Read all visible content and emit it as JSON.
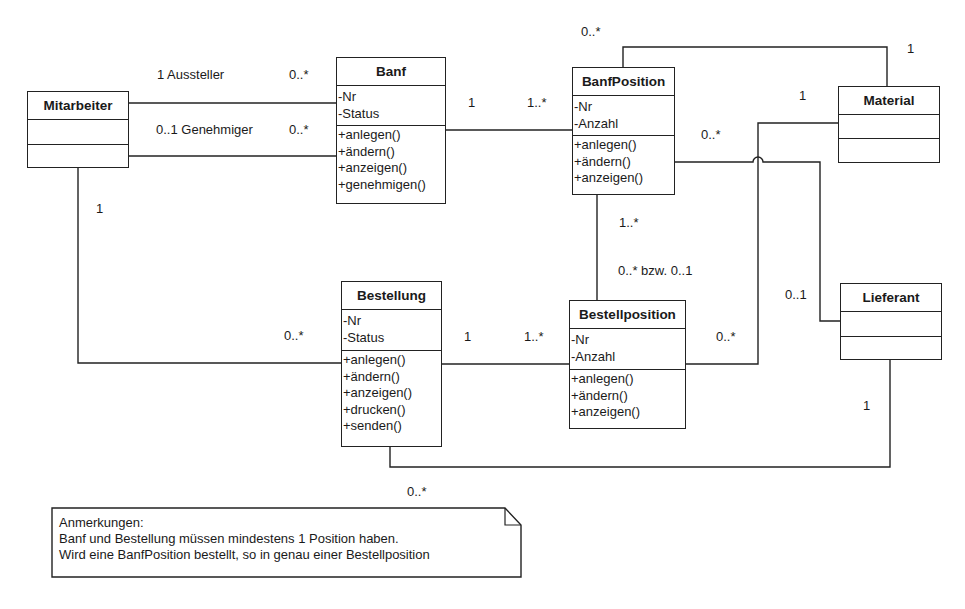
{
  "diagram": {
    "type": "UML class diagram",
    "classes": {
      "mitarbeiter": {
        "name": "Mitarbeiter",
        "attributes": [],
        "operations": []
      },
      "banf": {
        "name": "Banf",
        "attributes": [
          "-Nr",
          "-Status"
        ],
        "operations": [
          "+anlegen()",
          "+ändern()",
          "+anzeigen()",
          "+genehmigen()"
        ]
      },
      "banfposition": {
        "name": "BanfPosition",
        "attributes": [
          "-Nr",
          "-Anzahl"
        ],
        "operations": [
          "+anlegen()",
          "+ändern()",
          "+anzeigen()"
        ]
      },
      "material": {
        "name": "Material",
        "attributes": [],
        "operations": []
      },
      "bestellung": {
        "name": "Bestellung",
        "attributes": [
          "-Nr",
          "-Status"
        ],
        "operations": [
          "+anlegen()",
          "+ändern()",
          "+anzeigen()",
          "+drucken()",
          "+senden()"
        ]
      },
      "bestellposition": {
        "name": "Bestellposition",
        "attributes": [
          "-Nr",
          "-Anzahl"
        ],
        "operations": [
          "+anlegen()",
          "+ändern()",
          "+anzeigen()"
        ]
      },
      "lieferant": {
        "name": "Lieferant",
        "attributes": [],
        "operations": []
      }
    },
    "associations": [
      {
        "from": "Mitarbeiter",
        "to": "Banf",
        "role": "Aussteller",
        "from_mult": "1",
        "to_mult": "0..*"
      },
      {
        "from": "Mitarbeiter",
        "to": "Banf",
        "role": "Genehmiger",
        "from_mult": "0..1",
        "to_mult": "0..*"
      },
      {
        "from": "Banf",
        "to": "BanfPosition",
        "from_mult": "1",
        "to_mult": "1..*"
      },
      {
        "from": "BanfPosition",
        "to": "Material",
        "from_mult": "0..*",
        "to_mult": "1"
      },
      {
        "from": "Material",
        "to": "Bestellposition",
        "from_mult": "1",
        "to_mult": "0..*"
      },
      {
        "from": "BanfPosition",
        "to": "Lieferant",
        "from_mult": "0..*",
        "to_mult": "0..1"
      },
      {
        "from": "BanfPosition",
        "to": "Bestellposition",
        "from_mult": "1..*",
        "to_mult": "0..* bzw. 0..1"
      },
      {
        "from": "Mitarbeiter",
        "to": "Bestellung",
        "from_mult": "1",
        "to_mult": "0..*"
      },
      {
        "from": "Bestellung",
        "to": "Bestellposition",
        "from_mult": "1",
        "to_mult": "1..*"
      },
      {
        "from": "Lieferant",
        "to": "Bestellung",
        "from_mult": "1",
        "to_mult": "0..*"
      }
    ],
    "labels": {
      "aussteller": "1  Aussteller",
      "aussteller_to": "0..*",
      "genehmiger": "0..1  Genehmiger",
      "genehmiger_to": "0..*",
      "banf_bp_from": "1",
      "banf_bp_to": "1..*",
      "bp_mat_from": "0..*",
      "bp_mat_to": "1",
      "mat_bestpos_from": "1",
      "mat_bestpos_to": "0..*",
      "bp_lief_from": "0..*",
      "bp_lief_to": "0..1",
      "bp_bestpos_from": "1..*",
      "bp_bestpos_to": "0..* bzw. 0..1",
      "mit_best_from": "1",
      "mit_best_to": "0..*",
      "best_bestpos_from": "1",
      "best_bestpos_to": "1..*",
      "lief_best_from": "1",
      "lief_best_to": "0..*"
    },
    "note": {
      "title": "Anmerkungen:",
      "line1": "Banf und Bestellung müssen mindestens 1 Position haben.",
      "line2": "Wird eine BanfPosition bestellt, so in genau einer Bestellposition"
    },
    "colors": {
      "line": "#222222",
      "background": "#ffffff",
      "text": "#1a1a1a"
    }
  }
}
